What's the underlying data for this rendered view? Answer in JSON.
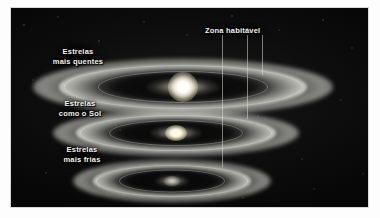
{
  "figure": {
    "background_color": "#0a0a0a",
    "border_color": "#d8d8d8"
  },
  "annotations": {
    "habitable_zone": {
      "label": "Zona habitável",
      "x": 205,
      "y": 27
    }
  },
  "guide_lines": [
    {
      "name": "hz-line-inner",
      "x": 222,
      "top": 35,
      "height": 132
    },
    {
      "name": "hz-line-middle",
      "x": 247,
      "top": 35,
      "height": 84
    },
    {
      "name": "hz-line-outer",
      "x": 262,
      "top": 35,
      "height": 40
    }
  ],
  "systems": [
    {
      "id": "hot-stars",
      "label": "Estrelas\nmais quentes",
      "label_x": 40,
      "label_y": 47,
      "center_x": 183,
      "center_y": 59,
      "disk_width": 300,
      "disk_height": 56,
      "star_size": 22,
      "star_class": "star-hot",
      "star_brightness": "very-bright",
      "hz_distance": "far",
      "description": "Estrela mais quente, zona habitável mais afastada e disco maior"
    },
    {
      "id": "sun-like-stars",
      "label": "Estrelas\ncomo o Sol",
      "label_x": 42,
      "label_y": 99,
      "center_x": 176,
      "center_y": 110,
      "disk_width": 246,
      "disk_height": 46,
      "star_size": 15,
      "star_class": "star-sun",
      "star_brightness": "bright",
      "hz_distance": "medium",
      "description": "Estrela semelhante ao Sol, zona habitável intermédia"
    },
    {
      "id": "cool-stars",
      "label": "Estrelas\nmais frias",
      "label_x": 44,
      "label_y": 145,
      "center_x": 172,
      "center_y": 159,
      "disk_width": 198,
      "disk_height": 42,
      "star_size": 11,
      "star_class": "star-cool",
      "star_brightness": "dim",
      "hz_distance": "near",
      "description": "Estrela mais fria, zona habitável mais próxima e disco menor"
    }
  ],
  "colors": {
    "star_hot": "#ffffff",
    "star_sun": "#fffdf4",
    "star_cool": "#e4e2d6",
    "dust_bright": "#f5f5ee",
    "dust_dark": "#080808",
    "guide_line": "#e1e1da",
    "label_text": "#f2f2ee"
  }
}
